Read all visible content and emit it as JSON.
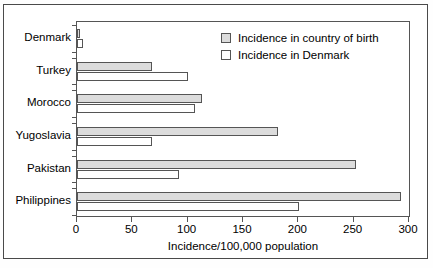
{
  "chart_data": {
    "type": "bar",
    "orientation": "horizontal",
    "title": "",
    "xlabel": "Incidence/100,000 population",
    "ylabel": "",
    "xlim": [
      0,
      300
    ],
    "xticks": [
      0,
      50,
      100,
      150,
      200,
      250,
      300
    ],
    "xtick_labels": [
      "0",
      "50",
      "100",
      "150",
      "200",
      "250",
      "300"
    ],
    "grid": false,
    "legend_position": "top-right",
    "categories": [
      "Denmark",
      "Turkey",
      "Morocco",
      "Yugoslavia",
      "Pakistan",
      "Philippines"
    ],
    "series": [
      {
        "name": "Incidence in country of birth",
        "fill": "#dcdcdc",
        "values": [
          3,
          68,
          113,
          182,
          252,
          293
        ]
      },
      {
        "name": "Incidence in Denmark",
        "fill": "#ffffff",
        "values": [
          5,
          100,
          107,
          68,
          92,
          201
        ]
      }
    ]
  },
  "legend": {
    "items": [
      {
        "label": "Incidence in country of birth",
        "swatch": "birth"
      },
      {
        "label": "Incidence in Denmark",
        "swatch": "denmark"
      }
    ]
  },
  "caption": {
    "text": ""
  },
  "colors": {
    "bar_birth": "#dcdcdc",
    "bar_denmark": "#ffffff",
    "stroke": "#555555",
    "frame": "#4a4a4a",
    "text": "#000000"
  }
}
